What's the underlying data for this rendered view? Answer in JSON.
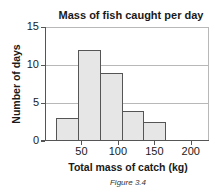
{
  "chart_data": {
    "type": "bar",
    "subtype": "histogram",
    "title": "Mass of fish caught per day",
    "xlabel": "Total mass of catch (kg)",
    "ylabel": "Number of days",
    "caption": "Figure 3.4",
    "bins": [
      {
        "from": 15,
        "to": 45,
        "value": 3
      },
      {
        "from": 45,
        "to": 75,
        "value": 12
      },
      {
        "from": 75,
        "to": 105,
        "value": 9
      },
      {
        "from": 105,
        "to": 135,
        "value": 4
      },
      {
        "from": 135,
        "to": 165,
        "value": 2.5
      }
    ],
    "categories": [
      "15-45",
      "45-75",
      "75-105",
      "105-135",
      "135-165"
    ],
    "values": [
      3,
      12,
      9,
      4,
      2.5
    ],
    "xlim": [
      0,
      225
    ],
    "ylim": [
      0,
      15
    ],
    "xticks": [
      50,
      100,
      150,
      200
    ],
    "yticks": [
      0,
      5,
      10,
      15
    ],
    "xtick_labels": [
      "50",
      "100",
      "150",
      "200"
    ],
    "ytick_labels": [
      "0",
      "5",
      "10",
      "15"
    ],
    "grid": "horizontal",
    "legend": null,
    "colors": {
      "bar_fill": "#e6e6e6",
      "bar_edge": "#555555",
      "grid": "#b8b8b8"
    }
  }
}
